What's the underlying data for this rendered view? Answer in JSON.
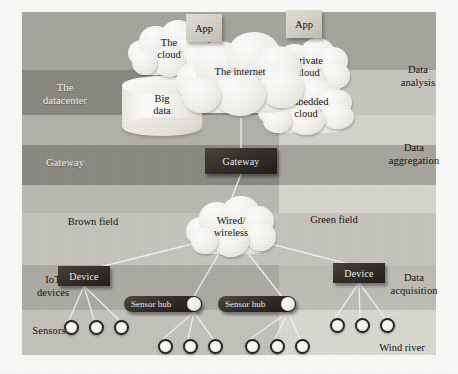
{
  "diagram": {
    "canvas": {
      "width": 458,
      "height": 374
    },
    "colors": {
      "band_dark_left": "#8d8d85",
      "band_mid_left": "#a5a49c",
      "band_light_left": "#c3c2ba",
      "band_pale": "#d8d7cf",
      "band_dark_right": "#9a998f",
      "node_dark": "#2f2a25",
      "cloud_white": "#f7f6f2",
      "app_grey": "#d6d4ca",
      "line": "#f3f2ee",
      "page_bg": "#ffffff"
    },
    "bands": [
      {
        "id": "top",
        "y": 12,
        "h": 58,
        "left_fill": "#a8a79f",
        "right_fill": "#a8a79f",
        "left_label": "",
        "right_label": ""
      },
      {
        "id": "datacenter",
        "y": 70,
        "h": 45,
        "left_fill": "#8a8a82",
        "right_fill": "#c9c8c0",
        "left_label": "The\ndatacenter",
        "right_label": ""
      },
      {
        "id": "data-analysis",
        "y": 115,
        "h": 30,
        "left_fill": "#b4b3ab",
        "right_fill": "#d6d5cd",
        "left_label": "",
        "right_label": "Data\nanalysis"
      },
      {
        "id": "gateway",
        "y": 145,
        "h": 40,
        "left_fill": "#8d8c84",
        "right_fill": "#a9a8a0",
        "left_label": "Gateway",
        "right_label": ""
      },
      {
        "id": "data-aggregation",
        "y": 185,
        "h": 28,
        "left_fill": "#bcbbb3",
        "right_fill": "#d9d8d0",
        "left_label": "",
        "right_label": "Data\naggregation"
      },
      {
        "id": "field",
        "y": 213,
        "h": 52,
        "left_fill": "#c7c6be",
        "right_fill": "#c7c6be",
        "left_label": "",
        "right_label": ""
      },
      {
        "id": "iot-devices",
        "y": 265,
        "h": 45,
        "left_fill": "#aeada5",
        "right_fill": "#c0bfb7",
        "left_label": "IoT\ndevices",
        "right_label": ""
      },
      {
        "id": "sensors",
        "y": 310,
        "h": 45,
        "left_fill": "#c5c4bc",
        "right_fill": "#dcdbd3",
        "left_label": "Sensors",
        "right_label": ""
      }
    ],
    "band_labels": {
      "datacenter_line1": "The",
      "datacenter_line2": "datacenter",
      "gateway": "Gateway",
      "iot_line1": "IoT",
      "iot_line2": "devices",
      "sensors": "Sensors",
      "data_analysis_line1": "Data",
      "data_analysis_line2": "analysis",
      "data_aggregation_line1": "Data",
      "data_aggregation_line2": "aggregation",
      "data_acquisition_line1": "Data",
      "data_acquisition_line2": "acquisition"
    },
    "field_labels": {
      "brown_field": "Brown field",
      "green_field": "Green field",
      "wind_river": "Wind river"
    },
    "clouds": [
      {
        "id": "the-cloud",
        "line1": "The",
        "line2": "cloud",
        "x": 128,
        "y": 20,
        "w": 82,
        "h": 58
      },
      {
        "id": "the-internet",
        "line1": "The internet",
        "line2": "",
        "x": 176,
        "y": 32,
        "w": 128,
        "h": 86
      },
      {
        "id": "private-cloud",
        "line1": "Private",
        "line2": "cloud",
        "x": 266,
        "y": 38,
        "w": 84,
        "h": 58
      },
      {
        "id": "embedded-cloud",
        "line1": "Embedded",
        "line2": "cloud",
        "x": 258,
        "y": 80,
        "w": 96,
        "h": 56
      },
      {
        "id": "wired-wireless",
        "line1": "Wired/",
        "line2": "wireless",
        "x": 186,
        "y": 196,
        "w": 90,
        "h": 62
      }
    ],
    "cylinder": {
      "id": "big-data",
      "line1": "Big",
      "line2": "data",
      "x": 122,
      "y": 76,
      "w": 80,
      "h": 60
    },
    "apps": [
      {
        "id": "app-left",
        "label": "App",
        "x": 186,
        "y": 14,
        "w": 36,
        "h": 28
      },
      {
        "id": "app-right",
        "label": "App",
        "x": 286,
        "y": 10,
        "w": 36,
        "h": 28
      }
    ],
    "nodes": {
      "gateway_box": {
        "label": "Gateway",
        "x": 205,
        "y": 148,
        "w": 72,
        "h": 26
      },
      "device_left": {
        "label": "Device",
        "x": 58,
        "y": 266,
        "w": 52,
        "h": 20
      },
      "device_right": {
        "label": "Device",
        "x": 333,
        "y": 263,
        "w": 52,
        "h": 20
      },
      "hub_left": {
        "label": "Sensor hub",
        "x": 124,
        "y": 296,
        "w": 78,
        "h": 16
      },
      "hub_right": {
        "label": "Sensor hub",
        "x": 218,
        "y": 296,
        "w": 78,
        "h": 16
      }
    },
    "sensors": [
      {
        "id": "s1",
        "group": "device-left",
        "x": 64,
        "y": 320
      },
      {
        "id": "s2",
        "group": "device-left",
        "x": 89,
        "y": 320
      },
      {
        "id": "s3",
        "group": "device-left",
        "x": 114,
        "y": 320
      },
      {
        "id": "s4",
        "group": "hub-left",
        "x": 158,
        "y": 339
      },
      {
        "id": "s5",
        "group": "hub-left",
        "x": 183,
        "y": 339
      },
      {
        "id": "s6",
        "group": "hub-left",
        "x": 208,
        "y": 339
      },
      {
        "id": "s7",
        "group": "hub-right",
        "x": 245,
        "y": 339
      },
      {
        "id": "s8",
        "group": "hub-right",
        "x": 270,
        "y": 339
      },
      {
        "id": "s9",
        "group": "hub-right",
        "x": 295,
        "y": 339
      },
      {
        "id": "s10",
        "group": "device-right",
        "x": 330,
        "y": 318
      },
      {
        "id": "s11",
        "group": "device-right",
        "x": 355,
        "y": 318
      },
      {
        "id": "s12",
        "group": "device-right",
        "x": 380,
        "y": 318
      }
    ],
    "links": [
      {
        "from": "the-internet",
        "to": "gateway_box",
        "x1": 241,
        "y1": 118,
        "x2": 241,
        "y2": 148
      },
      {
        "from": "gateway_box",
        "to": "wired-wireless",
        "x1": 241,
        "y1": 174,
        "x2": 231,
        "y2": 200
      },
      {
        "from": "wired-wireless",
        "to": "device_left",
        "x1": 208,
        "y1": 240,
        "x2": 96,
        "y2": 268
      },
      {
        "from": "wired-wireless",
        "to": "hub_left",
        "x1": 222,
        "y1": 248,
        "x2": 193,
        "y2": 298
      },
      {
        "from": "wired-wireless",
        "to": "hub_right",
        "x1": 244,
        "y1": 248,
        "x2": 283,
        "y2": 298
      },
      {
        "from": "wired-wireless",
        "to": "device_right",
        "x1": 256,
        "y1": 240,
        "x2": 352,
        "y2": 265
      },
      {
        "from": "device_left",
        "to": "s1",
        "x1": 84,
        "y1": 286,
        "x2": 69,
        "y2": 320
      },
      {
        "from": "device_left",
        "to": "s2",
        "x1": 84,
        "y1": 286,
        "x2": 94,
        "y2": 320
      },
      {
        "from": "device_left",
        "to": "s3",
        "x1": 84,
        "y1": 286,
        "x2": 119,
        "y2": 320
      },
      {
        "from": "hub_left",
        "to": "s4",
        "x1": 194,
        "y1": 312,
        "x2": 163,
        "y2": 339
      },
      {
        "from": "hub_left",
        "to": "s5",
        "x1": 194,
        "y1": 312,
        "x2": 188,
        "y2": 339
      },
      {
        "from": "hub_left",
        "to": "s6",
        "x1": 194,
        "y1": 312,
        "x2": 213,
        "y2": 339
      },
      {
        "from": "hub_right",
        "to": "s7",
        "x1": 288,
        "y1": 312,
        "x2": 250,
        "y2": 339
      },
      {
        "from": "hub_right",
        "to": "s8",
        "x1": 288,
        "y1": 312,
        "x2": 275,
        "y2": 339
      },
      {
        "from": "hub_right",
        "to": "s9",
        "x1": 288,
        "y1": 312,
        "x2": 300,
        "y2": 339
      },
      {
        "from": "device_right",
        "to": "s10",
        "x1": 359,
        "y1": 283,
        "x2": 335,
        "y2": 318
      },
      {
        "from": "device_right",
        "to": "s11",
        "x1": 359,
        "y1": 283,
        "x2": 360,
        "y2": 318
      },
      {
        "from": "device_right",
        "to": "s12",
        "x1": 359,
        "y1": 283,
        "x2": 385,
        "y2": 318
      }
    ]
  }
}
